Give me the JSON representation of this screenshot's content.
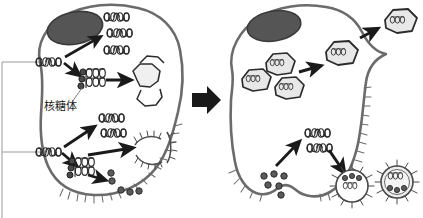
{
  "figure": {
    "type": "biological-process-diagram",
    "background_color": "#ffffff",
    "width": 423,
    "height": 218
  },
  "colors": {
    "membrane_stroke": "#6b6b6b",
    "nucleus_fill": "#555555",
    "nucleus_stroke": "#3a3a3a",
    "capsid_fill": "#e8e8e8",
    "capsid_stroke": "#2b2b2b",
    "rna_stroke": "#2b2b2b",
    "arrow_fill": "#1a1a1a",
    "protein_dot_fill": "#5a5a5a",
    "leader_line": "#808080",
    "bracket_line": "#9a9a9a",
    "text": "#1a1a1a"
  },
  "labels": {
    "ribosome": "核糖体"
  },
  "panels": [
    {
      "id": "left-cell",
      "name": "infected-cell-early",
      "nucleus": "nucleus",
      "contents": [
        "viral-rna-template-upper",
        "viral-rna-template-lower",
        "translated-rna-strands-upper",
        "translated-rna-strands-lower",
        "ribosome-complex-upper",
        "ribosome-complex-lower",
        "empty-capsid-shells",
        "membrane-fragments",
        "protein-subunit-dots"
      ]
    },
    {
      "id": "right-cell",
      "name": "infected-cell-late",
      "nucleus": "nucleus",
      "contents": [
        "assembled-naked-virions",
        "released-naked-virion",
        "viral-rna-strands",
        "glycoprotein-dots",
        "budding-enveloped-virion",
        "released-enveloped-virion"
      ]
    }
  ],
  "arrows": {
    "transition": "stage-transition-arrow",
    "count_left": 7,
    "count_right": 4
  },
  "bracket": {
    "name": "left-edge-bracket",
    "points_to": [
      "viral-rna-template-upper",
      "viral-rna-template-lower"
    ]
  }
}
